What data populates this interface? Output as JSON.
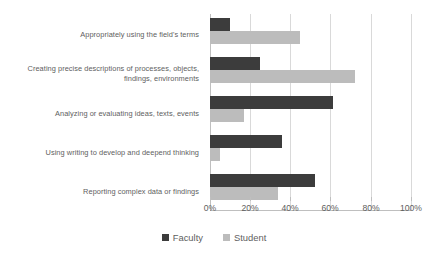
{
  "chart_data": {
    "type": "bar",
    "orientation": "horizontal",
    "title": "",
    "xlabel": "",
    "ylabel": "",
    "xlim": [
      0,
      100
    ],
    "xticks": [
      "0%",
      "20%",
      "40%",
      "60%",
      "80%",
      "100%"
    ],
    "xtick_values": [
      0,
      20,
      40,
      60,
      80,
      100
    ],
    "grid": true,
    "legend_position": "bottom",
    "categories": [
      "Appropriately using the field's terms",
      "Creating precise descriptions of processes, objects, findings, environments",
      "Analyzing or evaluating ideas, texts, events",
      "Using writing to develop and deepend thinking",
      "Reporting complex data or findings"
    ],
    "series": [
      {
        "name": "Faculty",
        "color": "#3c3c3c",
        "values": [
          10,
          25,
          61,
          36,
          52
        ]
      },
      {
        "name": "Student",
        "color": "#bcbcbc",
        "values": [
          45,
          72,
          17,
          5,
          34
        ]
      }
    ]
  },
  "legend": {
    "items": [
      {
        "label": "Faculty",
        "swatch": "faculty"
      },
      {
        "label": "Student",
        "swatch": "student"
      }
    ]
  }
}
